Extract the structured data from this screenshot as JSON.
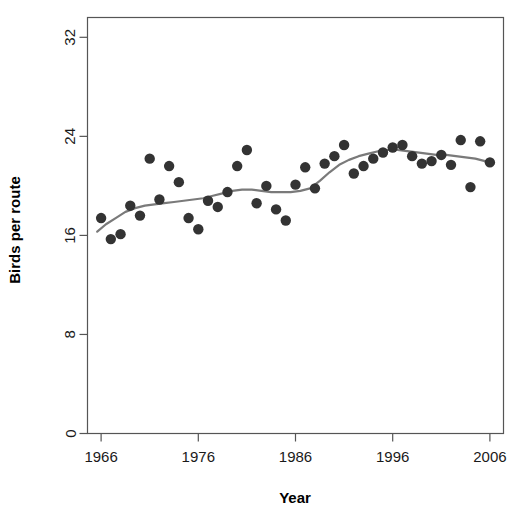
{
  "chart_data": {
    "type": "scatter",
    "title": "",
    "xlabel": "Year",
    "ylabel": "Birds per route",
    "xlim": [
      1964.6,
      2007.4
    ],
    "ylim": [
      0,
      33.6
    ],
    "grid": false,
    "legend": null,
    "xticks": [
      1966,
      1976,
      1986,
      1996,
      2006
    ],
    "xtick_labels": [
      "1966",
      "1976",
      "1986",
      "1996",
      "2006"
    ],
    "yticks": [
      0,
      8,
      16,
      24,
      32
    ],
    "ytick_labels": [
      "0",
      "8",
      "16",
      "24",
      "32"
    ],
    "point_color": "#333333",
    "line_color": "#7a7a7a",
    "axis_color": "#555555",
    "background": "#ffffff",
    "series": [
      {
        "name": "Birds per route",
        "type": "scatter",
        "x": [
          1966,
          1967,
          1968,
          1969,
          1970,
          1971,
          1972,
          1973,
          1974,
          1975,
          1976,
          1977,
          1978,
          1979,
          1980,
          1981,
          1982,
          1983,
          1984,
          1985,
          1986,
          1987,
          1988,
          1989,
          1990,
          1991,
          1992,
          1993,
          1994,
          1995,
          1996,
          1997,
          1998,
          1999,
          2000,
          2001,
          2002,
          2003,
          2004,
          2005,
          2006
        ],
        "values": [
          17.4,
          15.7,
          16.1,
          18.4,
          17.6,
          22.2,
          18.9,
          21.6,
          20.3,
          17.4,
          16.5,
          18.8,
          18.3,
          19.5,
          21.6,
          22.9,
          18.6,
          20.0,
          18.1,
          17.2,
          20.1,
          21.5,
          19.8,
          21.8,
          22.4,
          23.3,
          21.0,
          21.6,
          22.2,
          22.7,
          23.1,
          23.3,
          22.4,
          21.8,
          22.0,
          22.5,
          21.7,
          23.7,
          19.9,
          23.6,
          21.9
        ]
      },
      {
        "name": "LOESS smoother",
        "type": "line",
        "x": [
          1965.6,
          1966.5,
          1967.5,
          1968.5,
          1969.5,
          1970.5,
          1971.5,
          1972.5,
          1973.5,
          1974.5,
          1975.5,
          1976.5,
          1977.5,
          1978.5,
          1979.5,
          1980.5,
          1981.5,
          1982.5,
          1983.5,
          1984.5,
          1985.5,
          1986.5,
          1987.5,
          1988.5,
          1989.5,
          1990.5,
          1991.5,
          1992.5,
          1993.5,
          1994.5,
          1995.5,
          1996.5,
          1997.5,
          1998.5,
          1999.5,
          2000.5,
          2001.5,
          2002.5,
          2003.5,
          2004.5,
          2005.5,
          2006.4
        ],
        "values": [
          16.3,
          16.9,
          17.4,
          17.9,
          18.2,
          18.4,
          18.5,
          18.6,
          18.7,
          18.8,
          18.9,
          19.0,
          19.2,
          19.4,
          19.6,
          19.7,
          19.7,
          19.6,
          19.5,
          19.5,
          19.5,
          19.6,
          19.8,
          20.4,
          21.1,
          21.7,
          22.1,
          22.4,
          22.6,
          22.8,
          22.9,
          22.9,
          22.8,
          22.7,
          22.6,
          22.5,
          22.5,
          22.4,
          22.3,
          22.2,
          22.0,
          21.8
        ]
      }
    ]
  }
}
